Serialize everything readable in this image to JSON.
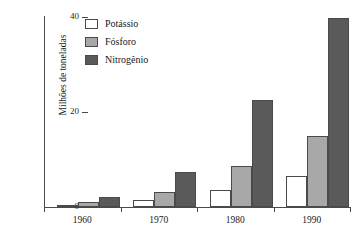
{
  "chart_data": {
    "type": "bar",
    "title": "",
    "xlabel": "",
    "ylabel": "Milhões de toneladas",
    "categories": [
      "1960",
      "1970",
      "1980",
      "1990"
    ],
    "series": [
      {
        "name": "Potássio",
        "color": "#ffffff",
        "values": [
          0.4,
          1.5,
          3.6,
          6.5
        ]
      },
      {
        "name": "Fósforo",
        "color": "#a8a8a8",
        "values": [
          1.1,
          3.1,
          8.6,
          15.0
        ]
      },
      {
        "name": "Nitrogênio",
        "color": "#5a5a5a",
        "values": [
          2.1,
          7.3,
          22.5,
          39.8
        ]
      }
    ],
    "ylim": [
      0,
      40
    ],
    "yticks": [
      0,
      20,
      40
    ],
    "ytick_labels": [
      "0",
      "20",
      "40"
    ],
    "grid": false,
    "legend_position": "top-left",
    "axis_color": "#4a4a4a"
  },
  "legend": {
    "items": [
      {
        "label": "Potássio"
      },
      {
        "label": "Fósforo"
      },
      {
        "label": "Nitrogênio"
      }
    ]
  }
}
